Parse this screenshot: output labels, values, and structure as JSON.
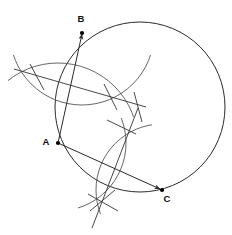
{
  "figure": {
    "type": "geometry-construction",
    "background_color": "#ffffff",
    "stroke_color": "#2a2a2a",
    "arc_color": "#555555",
    "points": [
      {
        "id": "A",
        "label": "A",
        "x": 58,
        "y": 143,
        "label_x": 46,
        "label_y": 142
      },
      {
        "id": "B",
        "label": "B",
        "x": 82,
        "y": 33,
        "label_x": 81,
        "label_y": 19
      },
      {
        "id": "C",
        "label": "C",
        "x": 162,
        "y": 190,
        "label_x": 167,
        "label_y": 199
      }
    ],
    "circle": {
      "name": "circumcircle",
      "cx": 140,
      "cy": 107,
      "r": 85
    },
    "chords": [
      {
        "name": "chord-AB",
        "from": "A",
        "to": "B",
        "arrow_at": "B"
      },
      {
        "name": "chord-AC",
        "from": "A",
        "to": "C",
        "arrow_at": "C"
      }
    ],
    "bisectors": [
      {
        "name": "perpendicular-bisector-AB",
        "x1": 14,
        "y1": 69,
        "x2": 146,
        "y2": 107,
        "arc_intersections": [
          {
            "x": 36,
            "y": 76
          },
          {
            "x": 110,
            "y": 97
          }
        ]
      },
      {
        "name": "perpendicular-bisector-AC",
        "x1": 138,
        "y1": 108,
        "x2": 92,
        "y2": 228,
        "arc_intersections": [
          {
            "x": 123,
            "y": 128
          },
          {
            "x": 103,
            "y": 203
          }
        ]
      }
    ],
    "construction_arcs": [
      {
        "name": "arc-from-A-for-AB",
        "cx": 58,
        "cy": 143,
        "r": 80
      },
      {
        "name": "arc-from-B-for-AB",
        "cx": 82,
        "cy": 33,
        "r": 72
      },
      {
        "name": "arc-from-A-for-AC",
        "cx": 58,
        "cy": 143,
        "r": 68
      },
      {
        "name": "arc-from-C-for-AC",
        "cx": 162,
        "cy": 190,
        "r": 66
      }
    ]
  }
}
